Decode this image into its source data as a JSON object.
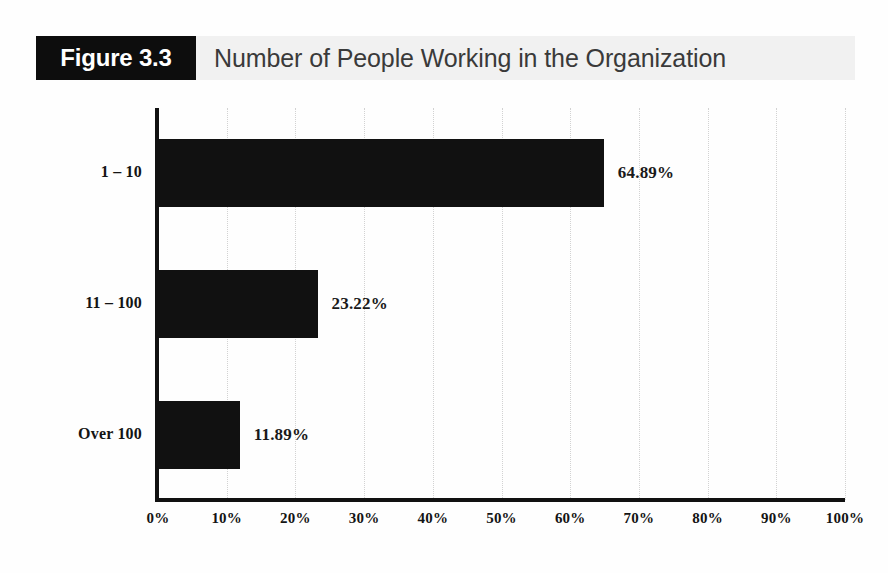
{
  "figure": {
    "badge_label": "Figure 3.3",
    "title": "Number of People Working in the Organization"
  },
  "colors": {
    "bar": "#111111",
    "badge_background": "#0d0d0d",
    "badge_text": "#ffffff",
    "header_band": "#f1f1f1",
    "title_text": "#3a3a3a",
    "axis": "#111111",
    "gridline": "#d2d2d2",
    "page_background": "#fefefe"
  },
  "chart_data": {
    "type": "bar",
    "orientation": "horizontal",
    "title": "Number of People Working in the Organization",
    "xlabel": "",
    "ylabel": "",
    "categories": [
      "1 – 10",
      "11 – 100",
      "Over 100"
    ],
    "values": [
      64.89,
      23.22,
      11.89
    ],
    "value_labels": [
      "64.89%",
      "23.22%",
      "11.89%"
    ],
    "xlim": [
      0,
      100
    ],
    "xticks": [
      0,
      10,
      20,
      30,
      40,
      50,
      60,
      70,
      80,
      90,
      100
    ],
    "xtick_labels": [
      "0%",
      "10%",
      "20%",
      "30%",
      "40%",
      "50%",
      "60%",
      "70%",
      "80%",
      "90%",
      "100%"
    ],
    "grid": true,
    "grid_axis": "x",
    "grid_style": "dotted",
    "legend": false,
    "series": [
      {
        "name": "Share of respondents",
        "values": [
          64.89,
          23.22,
          11.89
        ]
      }
    ]
  }
}
